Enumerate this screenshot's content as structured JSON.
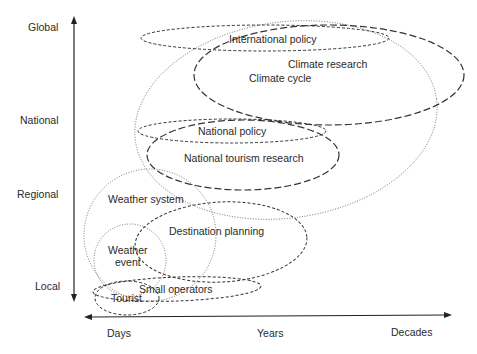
{
  "y_axis": {
    "labels": [
      "Global",
      "National",
      "Regional",
      "Local"
    ]
  },
  "x_axis": {
    "labels": [
      "Days",
      "Years",
      "Decades"
    ]
  },
  "domains": [
    {
      "id": "international-policy",
      "label": "International policy",
      "style": "dashed-fine"
    },
    {
      "id": "climate-research",
      "label": "Climate research",
      "style": "dashed-long"
    },
    {
      "id": "climate-cycle",
      "label": "Climate cycle",
      "style": "dotted"
    },
    {
      "id": "national-policy",
      "label": "National policy",
      "style": "dashed-fine"
    },
    {
      "id": "national-tourism-research",
      "label": "National tourism research",
      "style": "dashed-long"
    },
    {
      "id": "weather-system",
      "label": "Weather system",
      "style": "dotted"
    },
    {
      "id": "destination-planning",
      "label": "Destination planning",
      "style": "dashed-fine"
    },
    {
      "id": "weather-event",
      "label": "Weather event",
      "label_lines": [
        "Weather",
        "event"
      ],
      "style": "dotted"
    },
    {
      "id": "small-operators",
      "label": "Small operators",
      "style": "dashed-fine"
    },
    {
      "id": "tourist",
      "label": "Tourist",
      "style": "dashed-fine"
    }
  ]
}
